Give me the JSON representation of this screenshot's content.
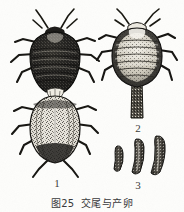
{
  "figure": {
    "caption_full": "图 25  交尾与产卵",
    "caption_figure_word": "图",
    "caption_number": "25",
    "caption_title": "交尾与产卵",
    "background_color": "#fdfdfb",
    "ink_color": "#1c1c1a",
    "label_color": "#3a3a38"
  },
  "panels": [
    {
      "label": "1",
      "name": "mating-pair",
      "description": "交尾的一对成虫，上方雄虫体色深，下方雌虫体色浅具斑纹"
    },
    {
      "label": "2",
      "name": "ovipositing-female",
      "description": "产卵中的雌虫，腹端伸出产卵管"
    },
    {
      "label": "3",
      "name": "eggs",
      "description": "卵三粒，长弯曲形"
    }
  ]
}
